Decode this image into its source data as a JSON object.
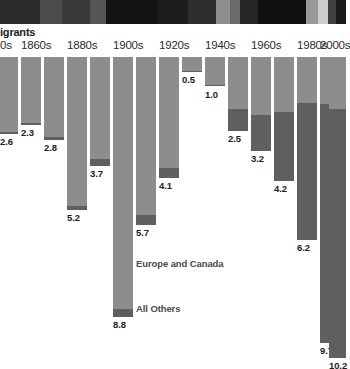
{
  "photo_strip": {
    "name": "photo-banner",
    "segments": [
      {
        "x": 0,
        "w": 40,
        "color": "#2a2a2a"
      },
      {
        "x": 40,
        "w": 22,
        "color": "#4b4b4b"
      },
      {
        "x": 62,
        "w": 28,
        "color": "#3a3a3a"
      },
      {
        "x": 90,
        "w": 16,
        "color": "#565656"
      },
      {
        "x": 106,
        "w": 52,
        "color": "#141414"
      },
      {
        "x": 158,
        "w": 30,
        "color": "#1d1d1d"
      },
      {
        "x": 188,
        "w": 28,
        "color": "#2e2e2e"
      },
      {
        "x": 216,
        "w": 14,
        "color": "#8e8e8e"
      },
      {
        "x": 230,
        "w": 10,
        "color": "#6a6a6a"
      },
      {
        "x": 240,
        "w": 18,
        "color": "#262626"
      },
      {
        "x": 258,
        "w": 48,
        "color": "#101010"
      },
      {
        "x": 306,
        "w": 12,
        "color": "#9a9a9a"
      },
      {
        "x": 318,
        "w": 10,
        "color": "#cfcfcf"
      },
      {
        "x": 328,
        "w": 8,
        "color": "#3f3f3f"
      },
      {
        "x": 336,
        "w": 10,
        "color": "#1b1b1b"
      }
    ]
  },
  "chart_data": {
    "type": "bar",
    "title": "igrants",
    "title_truncated": true,
    "xlabel": "",
    "ylabel": "",
    "orientation": "downward",
    "stacked": true,
    "grid": false,
    "legend_position": "inside-center",
    "value_unit": "millions",
    "ylim": [
      0,
      10.2
    ],
    "categories": [
      "1850s",
      "1860s",
      "1870s",
      "1880s",
      "1890s",
      "1900s",
      "1910s",
      "1920s",
      "1930s",
      "1940s",
      "1950s",
      "1960s",
      "1970s",
      "1980s",
      "1990s",
      "2000s"
    ],
    "visible_tick_labels": [
      {
        "text": "0s",
        "category": "1850s"
      },
      {
        "text": "1860s",
        "category": "1860s"
      },
      {
        "text": "1880s",
        "category": "1880s"
      },
      {
        "text": "1900s",
        "category": "1900s"
      },
      {
        "text": "1920s",
        "category": "1920s"
      },
      {
        "text": "1940s",
        "category": "1940s"
      },
      {
        "text": "1960s",
        "category": "1960s"
      },
      {
        "text": "1980s",
        "category": "1980s"
      },
      {
        "text": "2000s",
        "category": "2000s"
      }
    ],
    "totals": [
      2.6,
      2.3,
      2.8,
      5.2,
      3.7,
      8.8,
      5.7,
      4.1,
      0.5,
      1.0,
      2.5,
      3.2,
      4.2,
      6.2,
      9.7,
      10.2
    ],
    "series": [
      {
        "name": "Europe and Canada",
        "color": "#8d8d8d",
        "values": [
          2.55,
          2.25,
          2.72,
          5.05,
          3.45,
          8.55,
          5.35,
          3.75,
          0.47,
          0.95,
          1.75,
          1.95,
          1.85,
          1.55,
          1.6,
          1.75
        ]
      },
      {
        "name": "All Others",
        "color": "#5f5f5f",
        "values": [
          0.05,
          0.05,
          0.08,
          0.15,
          0.25,
          0.25,
          0.35,
          0.35,
          0.03,
          0.05,
          0.75,
          1.25,
          2.35,
          4.65,
          8.1,
          8.45
        ]
      }
    ],
    "value_labels": [
      "2.6",
      "2.3",
      "2.8",
      "5.2",
      "3.7",
      "8.8",
      "5.7",
      "4.1",
      "0.5",
      "1.0",
      "2.5",
      "3.2",
      "4.2",
      "6.2",
      "9.7",
      "10.2"
    ],
    "legend": [
      {
        "label": "Europe and Canada",
        "color": "#8d8d8d"
      },
      {
        "label": "All Others",
        "color": "#5f5f5f"
      }
    ]
  },
  "layout": {
    "bar_geometry": [
      {
        "x": 0,
        "w": 18
      },
      {
        "x": 21,
        "w": 20
      },
      {
        "x": 44,
        "w": 20
      },
      {
        "x": 67,
        "w": 20
      },
      {
        "x": 90,
        "w": 20
      },
      {
        "x": 113,
        "w": 20
      },
      {
        "x": 136,
        "w": 20
      },
      {
        "x": 159,
        "w": 20
      },
      {
        "x": 182,
        "w": 20
      },
      {
        "x": 205,
        "w": 20
      },
      {
        "x": 228,
        "w": 20
      },
      {
        "x": 251,
        "w": 20
      },
      {
        "x": 274,
        "w": 20
      },
      {
        "x": 297,
        "w": 20
      },
      {
        "x": 320,
        "w": 20
      },
      {
        "x": 329,
        "w": 17
      }
    ],
    "tick_x": [
      0,
      21,
      67,
      113,
      159,
      205,
      251,
      297,
      320
    ],
    "px_per_unit": 29.5,
    "watermark": {
      "x": 168,
      "y": 18,
      "w": 34,
      "h": 128
    }
  }
}
